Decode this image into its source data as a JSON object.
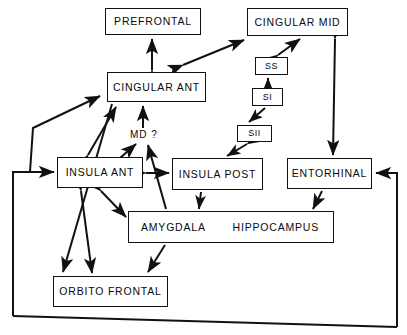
{
  "diagram": {
    "stroke_color": "#111111",
    "background_color": "#ffffff",
    "width": 407,
    "height": 335,
    "nodes": [
      {
        "id": "prefrontal",
        "label": "PREFRONTAL",
        "x": 105,
        "y": 8,
        "w": 96,
        "h": 27,
        "size": "big"
      },
      {
        "id": "cingular_mid",
        "label": "CINGULAR MID",
        "x": 247,
        "y": 8,
        "w": 101,
        "h": 28,
        "size": "big"
      },
      {
        "id": "cingular_ant",
        "label": "CINGULAR ANT",
        "x": 107,
        "y": 72,
        "w": 99,
        "h": 30,
        "size": "big"
      },
      {
        "id": "ss",
        "label": "SS",
        "x": 255,
        "y": 57,
        "w": 33,
        "h": 18,
        "size": "small"
      },
      {
        "id": "si",
        "label": "SI",
        "x": 252,
        "y": 88,
        "w": 31,
        "h": 18,
        "size": "small"
      },
      {
        "id": "sii",
        "label": "SII",
        "x": 237,
        "y": 125,
        "w": 35,
        "h": 17,
        "size": "small"
      },
      {
        "id": "insula_ant",
        "label": "INSULA ANT",
        "x": 57,
        "y": 157,
        "w": 86,
        "h": 31,
        "size": "big"
      },
      {
        "id": "insula_post",
        "label": "INSULA POST",
        "x": 172,
        "y": 158,
        "w": 91,
        "h": 32,
        "size": "big"
      },
      {
        "id": "entorhinal",
        "label": "ENTORHINAL",
        "x": 287,
        "y": 158,
        "w": 85,
        "h": 31,
        "size": "big"
      },
      {
        "id": "orbito",
        "label": "ORBITO FRONTAL",
        "x": 53,
        "y": 276,
        "w": 115,
        "h": 31,
        "size": "big"
      }
    ],
    "wide_node": {
      "id": "amygdala_hippocampus",
      "label_left": "AMYGDALA",
      "label_right": "HIPPOCAMPUS",
      "x": 128,
      "y": 211,
      "w": 206,
      "h": 32
    },
    "free_labels": [
      {
        "id": "md-question",
        "text": "MD  ?",
        "x": 130,
        "y": 129
      }
    ],
    "connections": [
      {
        "from": "cingular_ant",
        "to": "prefrontal",
        "heads": "both"
      },
      {
        "from": "cingular_ant",
        "to": "cingular_mid",
        "heads": "both"
      },
      {
        "from": "ss",
        "to": "cingular_mid",
        "heads": "both"
      },
      {
        "from": "si",
        "to": "ss",
        "heads": "to"
      },
      {
        "from": "si",
        "to": "sii",
        "heads": "to"
      },
      {
        "from": "sii",
        "to": "insula_post",
        "heads": "both"
      },
      {
        "from": "cingular_mid",
        "to": "entorhinal",
        "heads": "both"
      },
      {
        "from": "insula_ant",
        "to": "cingular_ant",
        "heads": "both"
      },
      {
        "from": "md_thalamus",
        "to": "cingular_ant",
        "heads": "to"
      },
      {
        "from": "insula_ant",
        "to": "md_thalamus",
        "heads": "to"
      },
      {
        "from": "amygdala",
        "to": "md_thalamus",
        "heads": "to"
      },
      {
        "from": "insula_ant",
        "to": "insula_post",
        "heads": "both"
      },
      {
        "from": "insula_ant",
        "to": "amygdala",
        "heads": "both"
      },
      {
        "from": "insula_ant",
        "to": "orbito",
        "heads": "both"
      },
      {
        "from": "amygdala",
        "to": "orbito",
        "heads": "to"
      },
      {
        "from": "entorhinal",
        "to": "hippocampus",
        "heads": "to"
      },
      {
        "from": "insula_post",
        "to": "amygdala",
        "heads": "to"
      },
      {
        "from": "cingular_ant",
        "to": "left_loop",
        "heads": "to"
      },
      {
        "from": "outer_loop",
        "to": "insula_ant",
        "heads": "to"
      },
      {
        "from": "outer_loop",
        "to": "entorhinal",
        "heads": "to"
      },
      {
        "from": "cingular_ant",
        "to": "orbito",
        "heads": "to"
      }
    ]
  }
}
